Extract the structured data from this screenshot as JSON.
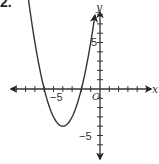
{
  "problem": {
    "number_label": "2."
  },
  "chart_data": {
    "type": "line",
    "title": "",
    "xlabel": "x",
    "ylabel": "y",
    "origin_label": "O",
    "tick_labels": {
      "x": [
        "-5"
      ],
      "y": [
        "5",
        "-5"
      ]
    },
    "xlim": [
      -10,
      6
    ],
    "ylim": [
      -8,
      9
    ],
    "grid": false,
    "legend": null,
    "series": [
      {
        "name": "parabola",
        "equation": "y = (x + 6)(x + 2)",
        "vertex": [
          -4,
          -4
        ],
        "x_intercepts": [
          -6,
          -2
        ],
        "x": [
          -8.5,
          -8,
          -7,
          -6,
          -5,
          -4,
          -3,
          -2,
          -1,
          -0.5
        ],
        "values": [
          14.25,
          12,
          5,
          0,
          -3,
          -4,
          -3,
          0,
          5,
          8.25
        ]
      }
    ]
  }
}
